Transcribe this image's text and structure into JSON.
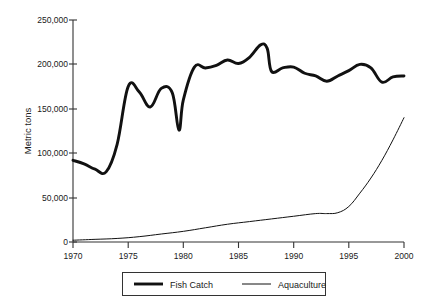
{
  "chart_data": {
    "type": "line",
    "title": "",
    "xlabel": "",
    "ylabel": "Metric tons",
    "xlim": [
      1970,
      2000
    ],
    "ylim": [
      0,
      250000
    ],
    "grid": false,
    "legend_position": "bottom",
    "xticks": [
      1970,
      1975,
      1980,
      1985,
      1990,
      1995,
      2000
    ],
    "xtick_labels": [
      "1970",
      "1975",
      "1980",
      "1985",
      "1990",
      "1995",
      "2000"
    ],
    "yticks": [
      0,
      50000,
      100000,
      150000,
      200000,
      250000
    ],
    "ytick_labels": [
      "0",
      "50,000",
      "100,000",
      "150,000",
      "200,000",
      "250,000"
    ],
    "series": [
      {
        "name": "Fish Catch",
        "line_style": "thick",
        "color": "#111111",
        "x": [
          1970,
          1971,
          1972,
          1973,
          1974,
          1975,
          1976,
          1977,
          1978,
          1979,
          1979.6,
          1980,
          1981,
          1982,
          1983,
          1984,
          1985,
          1986,
          1987,
          1987.6,
          1988,
          1989,
          1990,
          1991,
          1992,
          1993,
          1994,
          1995,
          1996,
          1997,
          1998,
          1999,
          2000
        ],
        "values": [
          92000,
          88000,
          82000,
          79000,
          110000,
          175000,
          169000,
          152000,
          173000,
          168000,
          126000,
          160000,
          197000,
          196000,
          199000,
          205000,
          201000,
          208000,
          222000,
          218000,
          192000,
          196000,
          197000,
          190000,
          187000,
          181000,
          187000,
          193000,
          200000,
          196000,
          180000,
          186000,
          187000
        ]
      },
      {
        "name": "Aquaculture",
        "line_style": "thin",
        "color": "#111111",
        "x": [
          1970,
          1972,
          1974,
          1976,
          1978,
          1980,
          1982,
          1984,
          1986,
          1988,
          1990,
          1992,
          1993,
          1994,
          1995,
          1996,
          1997,
          1998,
          1999,
          2000
        ],
        "values": [
          2000,
          3000,
          4000,
          6000,
          9000,
          12000,
          16000,
          20000,
          23000,
          26000,
          29000,
          32000,
          32000,
          33000,
          40000,
          55000,
          72000,
          92000,
          115000,
          140000
        ]
      }
    ]
  },
  "legend": {
    "entries": [
      {
        "label": "Fish Catch"
      },
      {
        "label": "Aquaculture"
      }
    ]
  },
  "axis": {
    "y_title": "Metric tons"
  }
}
